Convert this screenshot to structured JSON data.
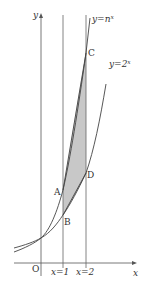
{
  "figure": {
    "axes": {
      "x_label": "x",
      "y_label": "y",
      "origin_label": "O"
    },
    "vertical_lines": [
      {
        "label": "x=1"
      },
      {
        "label": "x=2"
      }
    ],
    "curves": [
      {
        "label": "y=n^x",
        "label_text": "y=n",
        "label_sup": "x"
      },
      {
        "label": "y=2^x",
        "label_text": "y=2",
        "label_sup": "x"
      }
    ],
    "points": {
      "A": "A",
      "B": "B",
      "C": "C",
      "D": "D"
    },
    "shaded_region": {
      "vertices": [
        "A",
        "B",
        "D",
        "C"
      ],
      "color": "#c8c8c8"
    },
    "colors": {
      "line": "#555555",
      "shade": "#c8c8c8",
      "background": "#ffffff"
    }
  }
}
